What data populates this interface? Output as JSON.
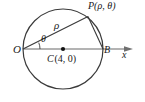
{
  "figure": {
    "type": "geometry-diagram",
    "background_color": "#ffffff",
    "stroke_color": "#3a3a3a",
    "axis_color": "#9a9a9a",
    "text_color": "#1a1a1a"
  },
  "labels": {
    "origin": "O",
    "point_b": "B",
    "axis": "x",
    "radius_segment": "ρ",
    "angle": "θ",
    "point_p": "P(ρ, θ)",
    "center_name": "C",
    "center_coords": "(4, 0)"
  },
  "geometry": {
    "circle": {
      "cx": 63,
      "cy": 49,
      "r": 40
    },
    "center_dot": {
      "cx": 63,
      "cy": 49,
      "r": 2.1
    },
    "origin_point": {
      "x": 23,
      "y": 49
    },
    "point_b": {
      "x": 103,
      "y": 49
    },
    "point_p": {
      "x": 88.0,
      "y": 16.6
    },
    "axis_line": {
      "x1": 23,
      "y1": 49,
      "x2": 133,
      "y2": 49
    },
    "axis_arrow_tip_x": 133,
    "angle_arc": {
      "cx": 23,
      "cy": 49,
      "r": 17,
      "start_deg": 0,
      "end_deg": 22
    },
    "segment_op": {
      "x1": 23,
      "y1": 49,
      "x2": 88.0,
      "y2": 16.6
    },
    "segment_pb": {
      "x1": 88.0,
      "y1": 16.6,
      "x2": 103,
      "y2": 49
    }
  }
}
